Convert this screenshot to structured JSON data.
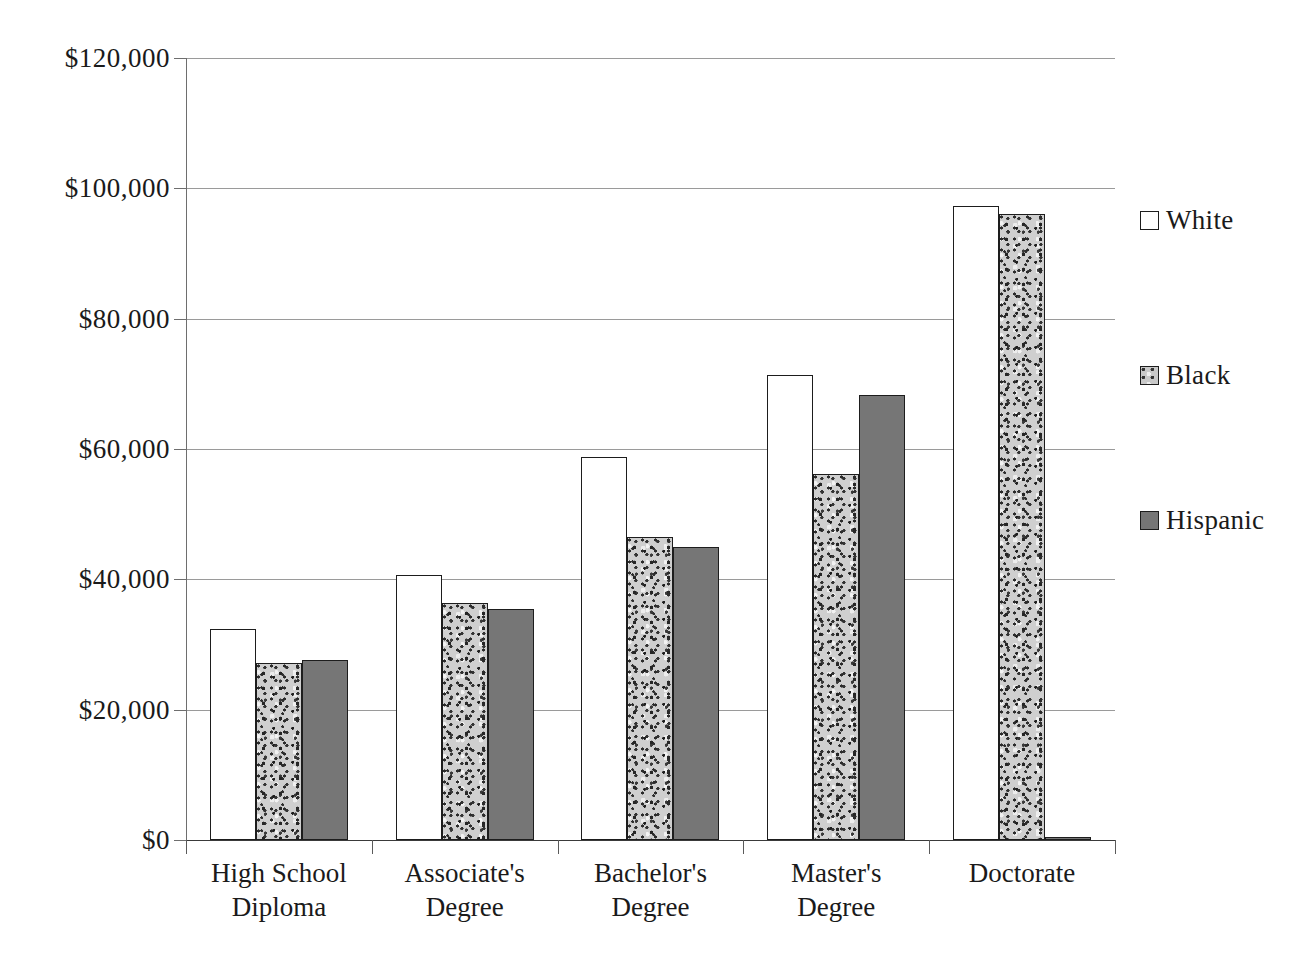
{
  "chart_data": {
    "type": "bar",
    "title": "",
    "xlabel": "",
    "ylabel": "",
    "categories": [
      "High School\nDiploma",
      "Associate's\nDegree",
      "Bachelor's\nDegree",
      "Master's\nDegree",
      "Doctorate"
    ],
    "series": [
      {
        "name": "White",
        "values": [
          32400,
          40700,
          58800,
          71300,
          97300
        ]
      },
      {
        "name": "Black",
        "values": [
          27100,
          36300,
          46500,
          56100,
          96000
        ]
      },
      {
        "name": "Hispanic",
        "values": [
          27600,
          35500,
          44900,
          68300,
          400
        ]
      }
    ],
    "ylim": [
      0,
      120000
    ],
    "ytick_values": [
      0,
      20000,
      40000,
      60000,
      80000,
      100000,
      120000
    ],
    "ytick_labels": [
      "$0",
      "$20,000",
      "$40,000",
      "$60,000",
      "$80,000",
      "$100,000",
      "$120,000"
    ],
    "grid": true,
    "legend_position": "right",
    "colors": {
      "white_series": "#ffffff",
      "black_series": "#cfcfcf",
      "hispanic_series": "#767676",
      "bar_outline": "#1d1d1d",
      "gridline": "#9a9a9a",
      "axis": "#3a3a3a",
      "text": "#1a1a1a",
      "background": "#ffffff"
    }
  },
  "legend": {
    "items": [
      {
        "label": "White",
        "swatch": "white-series"
      },
      {
        "label": "Black",
        "swatch": "black-series"
      },
      {
        "label": "Hispanic",
        "swatch": "hispanic-series"
      }
    ]
  },
  "caption": {
    "text": ""
  }
}
